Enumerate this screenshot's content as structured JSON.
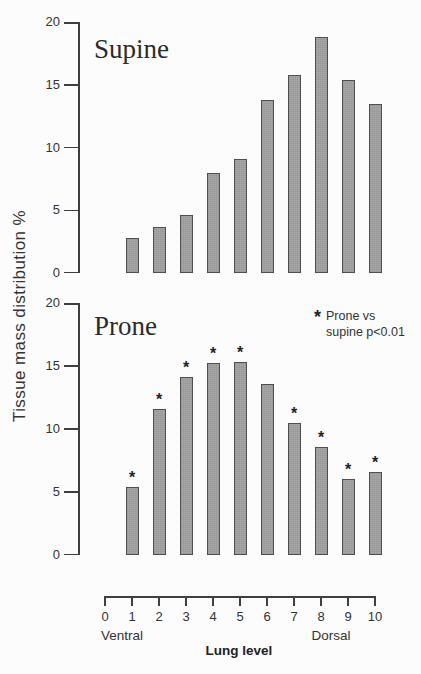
{
  "shared": {
    "y_axis_title": "Tissue mass distribution %",
    "significance_marker": "*"
  },
  "chart_data": [
    {
      "type": "bar",
      "title": "Supine",
      "xlabel": "Lung level",
      "ylabel": "Tissue mass distribution %",
      "ylim": [
        0,
        20
      ],
      "yticks": [
        0,
        5,
        10,
        15,
        20
      ],
      "categories": [
        "1",
        "2",
        "3",
        "4",
        "5",
        "6",
        "7",
        "8",
        "9",
        "10"
      ],
      "values": [
        2.8,
        3.7,
        4.6,
        8.0,
        9.1,
        13.8,
        15.8,
        18.8,
        15.4,
        13.5
      ],
      "significant": [
        false,
        false,
        false,
        false,
        false,
        false,
        false,
        false,
        false,
        false
      ]
    },
    {
      "type": "bar",
      "title": "Prone",
      "xlabel": "Lung level",
      "ylabel": "Tissue mass distribution %",
      "ylim": [
        0,
        20
      ],
      "yticks": [
        0,
        5,
        10,
        15,
        20
      ],
      "categories": [
        "1",
        "2",
        "3",
        "4",
        "5",
        "6",
        "7",
        "8",
        "9",
        "10"
      ],
      "values": [
        5.4,
        11.6,
        14.1,
        15.2,
        15.3,
        13.6,
        10.5,
        8.6,
        6.0,
        6.6
      ],
      "significant": [
        true,
        true,
        true,
        true,
        true,
        false,
        true,
        true,
        true,
        true
      ],
      "legend": {
        "symbol": "*",
        "lines": [
          "Prone vs",
          "supine p<0.01"
        ],
        "position": "top-right"
      }
    }
  ],
  "x_axis": {
    "ticks": [
      "0",
      "1",
      "2",
      "3",
      "4",
      "5",
      "6",
      "7",
      "8",
      "9",
      "10"
    ],
    "label": "Lung level",
    "left_caption": "Ventral",
    "right_caption": "Dorsal"
  },
  "colors": {
    "bar_fill": "#a9a9a9",
    "bar_border": "#4f4f4f",
    "axis": "#3f3f3f",
    "text": "#2e2e2e",
    "background": "#fcfcfc"
  }
}
